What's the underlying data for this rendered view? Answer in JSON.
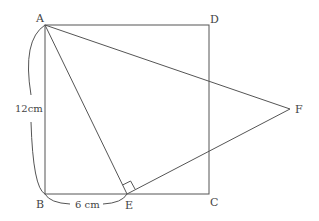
{
  "diagram": {
    "points": {
      "A": {
        "label": "A",
        "x": 45,
        "y": 25
      },
      "B": {
        "label": "B",
        "x": 45,
        "y": 194
      },
      "C": {
        "label": "C",
        "x": 209,
        "y": 194
      },
      "D": {
        "label": "D",
        "x": 209,
        "y": 25
      },
      "E": {
        "label": "E",
        "x": 127,
        "y": 194
      },
      "F": {
        "label": "F",
        "x": 290,
        "y": 109
      }
    },
    "dimensions": {
      "AB": "12cm",
      "BE": "6 cm"
    },
    "segments": [
      "AB",
      "BC",
      "CD",
      "DA",
      "AE",
      "AF",
      "EF"
    ],
    "right_angle_at": "E"
  }
}
